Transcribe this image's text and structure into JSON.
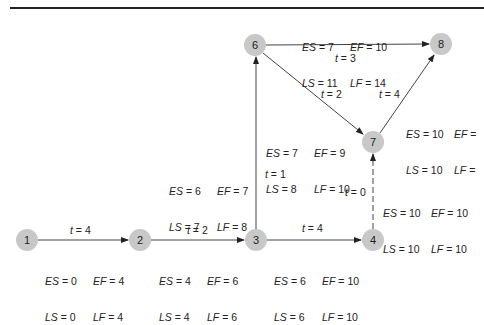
{
  "diagram": {
    "type": "activity-on-node network (PERT/CPM)",
    "nodes": [
      {
        "id": "1",
        "label": "1",
        "x": 27,
        "y": 240
      },
      {
        "id": "2",
        "label": "2",
        "x": 140,
        "y": 240
      },
      {
        "id": "3",
        "label": "3",
        "x": 256,
        "y": 240
      },
      {
        "id": "4",
        "label": "4",
        "x": 373,
        "y": 240
      },
      {
        "id": "6",
        "label": "6",
        "x": 255,
        "y": 45
      },
      {
        "id": "7",
        "label": "7",
        "x": 373,
        "y": 142
      },
      {
        "id": "8",
        "label": "8",
        "x": 441,
        "y": 44
      }
    ],
    "edges": [
      {
        "from": "1",
        "to": "2",
        "duration": "t = 4",
        "dashed": false
      },
      {
        "from": "2",
        "to": "3",
        "duration": "t = 2",
        "dashed": false
      },
      {
        "from": "3",
        "to": "4",
        "duration": "t = 4",
        "dashed": false
      },
      {
        "from": "3",
        "to": "6",
        "duration": "t = 1",
        "dashed": false
      },
      {
        "from": "6",
        "to": "8",
        "duration": "t = 3",
        "dashed": false
      },
      {
        "from": "6",
        "to": "7",
        "duration": "t = 2",
        "dashed": false
      },
      {
        "from": "7",
        "to": "8",
        "duration": "t = 4",
        "dashed": false
      },
      {
        "from": "4",
        "to": "7",
        "duration": "t = 0",
        "dashed": true
      }
    ],
    "activity_times": [
      {
        "edge": "1-2",
        "ES": "ES = 0",
        "EF": "EF = 4",
        "LS": "LS = 0",
        "LF": "LF = 4"
      },
      {
        "edge": "2-3",
        "ES": "ES = 4",
        "EF": "EF = 6",
        "LS": "LS = 4",
        "LF": "LF = 6"
      },
      {
        "edge": "3-4",
        "ES": "ES = 6",
        "EF": "EF = 10",
        "LS": "LS = 6",
        "LF": "LF = 10"
      },
      {
        "edge": "3-6",
        "ES": "ES = 6",
        "EF": "EF = 7",
        "LS": "LS = 7",
        "LF": "LF = 8"
      },
      {
        "edge": "6-8",
        "ES": "ES = 7",
        "EF": "EF = 10",
        "LS": "LS = 11",
        "LF": "LF = 14"
      },
      {
        "edge": "6-7",
        "ES": "ES = 7",
        "EF": "EF = 9",
        "LS": "LS = 8",
        "LF": "LF = 10"
      },
      {
        "edge": "7-8",
        "ES": "ES = 10",
        "EF": "EF =",
        "LS": "LS = 10",
        "LF": "LF ="
      },
      {
        "edge": "4-7",
        "ES": "ES = 10",
        "EF": "EF = 10",
        "LS": "LS = 10",
        "LF": "LF = 10"
      }
    ],
    "colors": {
      "node_fill": "#c8c8c8",
      "line": "#333333",
      "rule": "#222222"
    }
  }
}
